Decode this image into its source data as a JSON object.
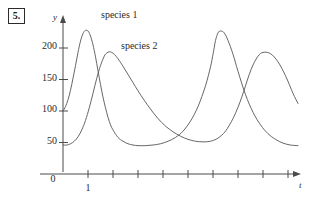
{
  "figure": {
    "problem_number": "5."
  },
  "chart_data": {
    "type": "line",
    "title": "",
    "xlabel": "t",
    "ylabel": "y",
    "grid": false,
    "legend_position": "inline-annotations",
    "xlim": [
      0,
      9.4
    ],
    "ylim": [
      0,
      245
    ],
    "x_ticks": [
      1,
      2,
      3,
      4,
      5,
      6,
      7,
      8,
      9
    ],
    "x_tick_labels": [
      "1",
      "",
      "",
      "",
      "",
      "",
      "",
      "",
      ""
    ],
    "y_ticks": [
      50,
      100,
      150,
      200
    ],
    "y_tick_labels": [
      "50",
      "100",
      "150",
      "200"
    ],
    "origin_label": "0",
    "annotations": [
      {
        "text": "species 1",
        "x": 1.55,
        "y": 237
      },
      {
        "text": "species 2",
        "x": 2.45,
        "y": 196
      }
    ],
    "series": [
      {
        "name": "species 1",
        "points_x": [
          0.0,
          0.1,
          0.2,
          0.3,
          0.4,
          0.5,
          0.6,
          0.7,
          0.8,
          0.9,
          1.0,
          1.05,
          1.1,
          1.2,
          1.3,
          1.4,
          1.5,
          1.6,
          1.7,
          1.8,
          1.9,
          2.0,
          2.2,
          2.4,
          2.6,
          2.8,
          3.0,
          3.3,
          3.6,
          3.9,
          4.2,
          4.5,
          4.8,
          5.1,
          5.4,
          5.7,
          5.9,
          6.0,
          6.05,
          6.1,
          6.2,
          6.3,
          6.45,
          6.6,
          6.8,
          7.0,
          7.3,
          7.6,
          7.9,
          8.2,
          8.5,
          8.8,
          9.1,
          9.4
        ],
        "points_y": [
          100,
          107,
          118,
          133,
          152,
          172,
          193,
          211,
          223,
          228,
          227,
          224,
          219,
          205,
          186,
          164,
          142,
          122,
          105,
          90,
          78,
          70,
          58,
          52,
          48,
          46,
          45,
          45,
          46,
          48,
          52,
          58,
          68,
          84,
          107,
          140,
          170,
          190,
          201,
          212,
          224,
          227,
          224,
          212,
          190,
          163,
          126,
          98,
          78,
          64,
          55,
          49,
          46,
          45
        ]
      },
      {
        "name": "species 2",
        "points_x": [
          0.0,
          0.15,
          0.3,
          0.45,
          0.6,
          0.75,
          0.9,
          1.05,
          1.2,
          1.35,
          1.5,
          1.65,
          1.75,
          1.85,
          1.95,
          2.05,
          2.2,
          2.4,
          2.6,
          2.8,
          3.0,
          3.25,
          3.5,
          3.8,
          4.1,
          4.4,
          4.7,
          5.0,
          5.3,
          5.6,
          5.9,
          6.2,
          6.5,
          6.8,
          7.0,
          7.15,
          7.3,
          7.45,
          7.6,
          7.8,
          8.0,
          8.3,
          8.6,
          8.9,
          9.2,
          9.4
        ],
        "points_y": [
          46,
          46,
          48,
          52,
          59,
          70,
          85,
          105,
          128,
          152,
          172,
          187,
          192,
          194,
          193,
          190,
          183,
          171,
          158,
          145,
          132,
          117,
          103,
          88,
          76,
          67,
          60,
          55,
          52,
          51,
          52,
          57,
          68,
          88,
          106,
          122,
          140,
          158,
          173,
          187,
          193,
          191,
          178,
          156,
          128,
          112
        ]
      }
    ]
  }
}
